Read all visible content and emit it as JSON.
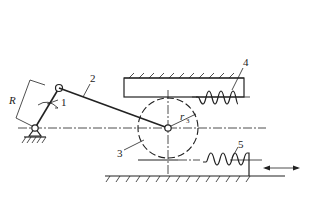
{
  "diagram": {
    "type": "mechanism-schematic",
    "labels": {
      "crank": "1",
      "connecting_rod": "2",
      "gear": "3",
      "upper_rack": "4",
      "lower_rack": "5",
      "crank_length": "R",
      "gear_radius": "r",
      "gear_radius_sub": "3"
    },
    "colors": {
      "line": "#222222",
      "background": "#ffffff"
    }
  }
}
